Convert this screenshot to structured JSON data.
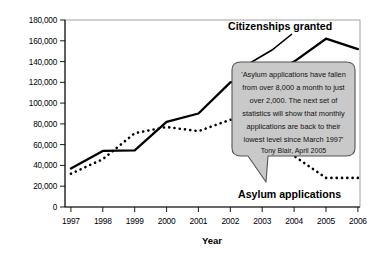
{
  "chart_data": {
    "type": "line",
    "title": "",
    "xlabel": "Year",
    "ylabel": "",
    "categories": [
      "1997",
      "1998",
      "1999",
      "2000",
      "2001",
      "2002",
      "2003",
      "2004",
      "2005",
      "2006"
    ],
    "x": [
      1997,
      1998,
      1999,
      2000,
      2001,
      2002,
      2003,
      2004,
      2005,
      2006
    ],
    "ylim": [
      0,
      180000
    ],
    "xlim": [
      1997,
      2006
    ],
    "grid": false,
    "legend_position": "inline-annotations",
    "ytick_labels": [
      "0",
      "20,000",
      "40,000",
      "60,000",
      "80,000",
      "100,000",
      "120,000",
      "140,000",
      "160,000",
      "180,000"
    ],
    "ytick_values": [
      0,
      20000,
      40000,
      60000,
      80000,
      100000,
      120000,
      140000,
      160000,
      180000
    ],
    "series": [
      {
        "name": "Citizenships granted",
        "style": "solid",
        "color": "#000000",
        "values": [
          37000,
          54000,
          54500,
          82000,
          90000,
          120000,
          125000,
          140000,
          162000,
          152000
        ]
      },
      {
        "name": "Asylum applications",
        "style": "dotted",
        "color": "#000000",
        "values": [
          32000,
          46000,
          71000,
          77000,
          73000,
          84000,
          81000,
          49000,
          28000,
          28000
        ]
      }
    ],
    "annotations": [
      {
        "name": "quote-callout",
        "lines": [
          "'Asylum applications have fallen",
          "from over 8,000 a month to just",
          "over 2,000. The next set of",
          "statistics will show that monthly",
          "applications are back to their",
          "lowest level since March 1997'"
        ],
        "attribution": "Tony Blair, April 2005",
        "fill": "#c9c9c9",
        "stroke": "#555555"
      }
    ]
  },
  "labels": {
    "citizenships": "Citizenships granted",
    "asylum": "Asylum applications",
    "axis_x": "Year"
  },
  "colors": {
    "line": "#000000",
    "callout_fill": "#c9c9c9",
    "callout_stroke": "#555555",
    "frame": "#777777",
    "background": "#ffffff"
  }
}
